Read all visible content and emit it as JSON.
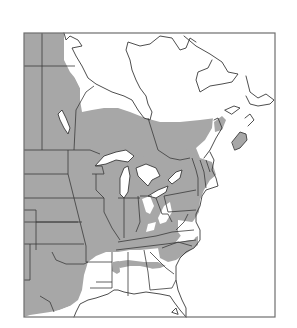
{
  "map": {
    "type": "species-range-map",
    "region": "Eastern North America",
    "frame": {
      "x": 24,
      "y": 33,
      "width": 251,
      "height": 284
    },
    "colors": {
      "range_fill": "#a7a7a7",
      "background": "#ffffff",
      "outline": "#3a3a3a",
      "frame": "#6e6e6e"
    },
    "legend": [],
    "labels": []
  }
}
